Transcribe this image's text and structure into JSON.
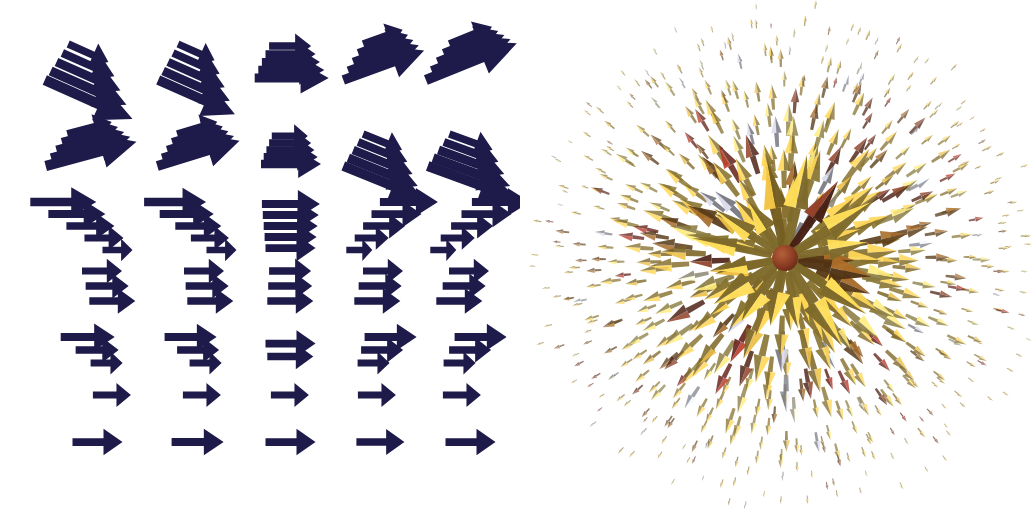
{
  "figure": {
    "width": 1033,
    "height": 509,
    "background_color": "#ffffff",
    "panel_count": 2
  },
  "panels": [
    {
      "id": "left-panel",
      "name": "2d-projected-vector-field",
      "caption": "",
      "glyph_type": "arrow",
      "glyph_color": "#1e1a4a",
      "background_color": "#ffffff",
      "grid_columns": 5,
      "grid_rows": 9,
      "description": "Dark navy 2D arrow glyphs arranged on a regular grid; upper two rows show clustered tilted arrow bundles, lower rows show horizontal arrows of varying length"
    },
    {
      "id": "right-panel",
      "name": "3d-radial-hedgehog-field",
      "caption": "",
      "glyph_type": "cone-arrow",
      "background_color": "#ffffff",
      "center_color": "#7a3520",
      "description": "3D radial hedgehog plot: shaded cone glyphs radiating outward from a dark red core, colored with a warm yellow-to-red colormap plus pale blue-gray accents"
    }
  ],
  "chart_data": [
    {
      "type": "quiver",
      "title": "",
      "xlabel": "",
      "ylabel": "",
      "panel": "left-panel",
      "color": "#1e1a4a",
      "xlim": [
        0,
        520
      ],
      "ylim": [
        0,
        509
      ],
      "grid": false,
      "legend": "none",
      "note": "Each cell holds a bundle of 1-6 arrows. angle is degrees (0 = +x, positive = up).",
      "cells": [
        {
          "cx": 88,
          "cy": 62,
          "angle": -24,
          "count": 5,
          "base_len": 44,
          "step": 13,
          "spread": 9
        },
        {
          "cx": 196,
          "cy": 62,
          "angle": -24,
          "count": 5,
          "base_len": 40,
          "step": 11,
          "spread": 9
        },
        {
          "cx": 288,
          "cy": 62,
          "angle": 0,
          "count": 5,
          "base_len": 42,
          "step": 8,
          "spread": 8
        },
        {
          "cx": 382,
          "cy": 62,
          "angle": 20,
          "count": 5,
          "base_len": 42,
          "step": 11,
          "spread": 9
        },
        {
          "cx": 470,
          "cy": 62,
          "angle": 22,
          "count": 5,
          "base_len": 46,
          "step": 13,
          "spread": 9
        },
        {
          "cx": 88,
          "cy": 150,
          "angle": 15,
          "count": 5,
          "base_len": 46,
          "step": 12,
          "spread": 8
        },
        {
          "cx": 196,
          "cy": 150,
          "angle": 17,
          "count": 5,
          "base_len": 42,
          "step": 11,
          "spread": 8
        },
        {
          "cx": 288,
          "cy": 150,
          "angle": 0,
          "count": 5,
          "base_len": 36,
          "step": 6,
          "spread": 7
        },
        {
          "cx": 382,
          "cy": 150,
          "angle": -22,
          "count": 5,
          "base_len": 42,
          "step": 11,
          "spread": 8
        },
        {
          "cx": 470,
          "cy": 150,
          "angle": -20,
          "count": 5,
          "base_len": 46,
          "step": 12,
          "spread": 8
        },
        {
          "cx": 88,
          "cy": 226,
          "angle": 0,
          "count": 5,
          "base_len": 66,
          "step": -9,
          "spread": 12,
          "skew": 14
        },
        {
          "cx": 196,
          "cy": 226,
          "angle": 0,
          "count": 5,
          "base_len": 62,
          "step": -8,
          "spread": 12,
          "skew": 12
        },
        {
          "cx": 288,
          "cy": 226,
          "angle": 0,
          "count": 5,
          "base_len": 58,
          "step": -2,
          "spread": 11,
          "skew": 0
        },
        {
          "cx": 382,
          "cy": 226,
          "angle": 0,
          "count": 5,
          "base_len": 58,
          "step": -8,
          "spread": 12,
          "skew": -12
        },
        {
          "cx": 470,
          "cy": 226,
          "angle": 0,
          "count": 5,
          "base_len": 58,
          "step": -8,
          "spread": 12,
          "skew": -14
        },
        {
          "cx": 105,
          "cy": 286,
          "angle": 0,
          "count": 3,
          "base_len": 40,
          "step": 3,
          "spread": 15,
          "skew": 5
        },
        {
          "cx": 205,
          "cy": 286,
          "angle": 0,
          "count": 3,
          "base_len": 40,
          "step": 3,
          "spread": 15,
          "skew": 3
        },
        {
          "cx": 288,
          "cy": 286,
          "angle": 0,
          "count": 3,
          "base_len": 42,
          "step": 2,
          "spread": 15,
          "skew": 0
        },
        {
          "cx": 378,
          "cy": 286,
          "angle": 0,
          "count": 3,
          "base_len": 40,
          "step": 3,
          "spread": 15,
          "skew": -3
        },
        {
          "cx": 462,
          "cy": 286,
          "angle": 0,
          "count": 3,
          "base_len": 40,
          "step": 3,
          "spread": 15,
          "skew": -5
        },
        {
          "cx": 95,
          "cy": 350,
          "angle": 0,
          "count": 3,
          "base_len": 54,
          "step": -11,
          "spread": 13,
          "skew": 10
        },
        {
          "cx": 196,
          "cy": 350,
          "angle": 0,
          "count": 3,
          "base_len": 52,
          "step": -10,
          "spread": 13,
          "skew": 8
        },
        {
          "cx": 288,
          "cy": 350,
          "angle": 0,
          "count": 2,
          "base_len": 50,
          "step": -4,
          "spread": 13,
          "skew": 0
        },
        {
          "cx": 380,
          "cy": 350,
          "angle": 0,
          "count": 3,
          "base_len": 52,
          "step": -10,
          "spread": 13,
          "skew": -8
        },
        {
          "cx": 468,
          "cy": 350,
          "angle": 0,
          "count": 3,
          "base_len": 52,
          "step": -10,
          "spread": 13,
          "skew": -10
        },
        {
          "cx": 110,
          "cy": 395,
          "angle": 0,
          "count": 1,
          "base_len": 38,
          "step": 0,
          "spread": 0
        },
        {
          "cx": 200,
          "cy": 395,
          "angle": 0,
          "count": 1,
          "base_len": 38,
          "step": 0,
          "spread": 0
        },
        {
          "cx": 288,
          "cy": 395,
          "angle": 0,
          "count": 1,
          "base_len": 38,
          "step": 0,
          "spread": 0
        },
        {
          "cx": 375,
          "cy": 395,
          "angle": 0,
          "count": 1,
          "base_len": 38,
          "step": 0,
          "spread": 0
        },
        {
          "cx": 460,
          "cy": 395,
          "angle": 0,
          "count": 1,
          "base_len": 38,
          "step": 0,
          "spread": 0
        },
        {
          "cx": 95,
          "cy": 442,
          "angle": 0,
          "count": 1,
          "base_len": 50,
          "step": 0,
          "spread": 0
        },
        {
          "cx": 195,
          "cy": 442,
          "angle": 0,
          "count": 1,
          "base_len": 52,
          "step": 0,
          "spread": 0
        },
        {
          "cx": 288,
          "cy": 442,
          "angle": 0,
          "count": 1,
          "base_len": 50,
          "step": 0,
          "spread": 0
        },
        {
          "cx": 378,
          "cy": 442,
          "angle": 0,
          "count": 1,
          "base_len": 48,
          "step": 0,
          "spread": 0
        },
        {
          "cx": 468,
          "cy": 442,
          "angle": 0,
          "count": 1,
          "base_len": 50,
          "step": 0,
          "spread": 0
        }
      ]
    },
    {
      "type": "quiver",
      "title": "",
      "xlabel": "",
      "ylabel": "",
      "panel": "right-panel",
      "grid": false,
      "legend": "none",
      "field": "radial-outward",
      "center": [
        265,
        258
      ],
      "max_radius": 248,
      "rings": 13,
      "glyphs_per_ring_base": 11,
      "colormap": [
        "#d9b64a",
        "#e0c96a",
        "#c8a23a",
        "#8d5a22",
        "#7a3520",
        "#9e2e20",
        "#b8b8c8",
        "#cfd3e2",
        "#e8e2c0",
        "#6b5a2a"
      ],
      "core_color": "#7a3520",
      "xlim": [
        0,
        513
      ],
      "ylim": [
        0,
        509
      ],
      "note": "3D hedgehog: cone glyph length scales with radius (largest near center), shaded warm colormap."
    }
  ]
}
